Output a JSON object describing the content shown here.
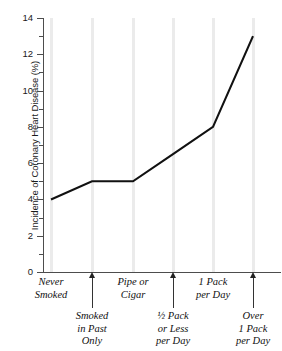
{
  "chart_data": {
    "type": "line",
    "title": "",
    "xlabel": "",
    "ylabel": "Incidence of Coronary Heart Disease (%)",
    "ylim": [
      0,
      14
    ],
    "ytick_labels": [
      "0",
      "2",
      "4",
      "6",
      "8",
      "10",
      "12",
      "14"
    ],
    "ytick_values": [
      0,
      2,
      4,
      6,
      8,
      10,
      12,
      14
    ],
    "yminor_values": [
      1,
      3,
      5,
      7,
      9,
      11,
      13
    ],
    "grid": "vertical-category-bands",
    "legend": "none",
    "categories": [
      "Never Smoked",
      "Smoked in Past Only",
      "Pipe or Cigar",
      "½ Pack or Less per Day",
      "1 Pack per Day",
      "Over 1 Pack per Day"
    ],
    "values": [
      4,
      5,
      5,
      6.5,
      8,
      13
    ],
    "line_color": "#111111",
    "gridline_color": "#ebebeb",
    "axis_color": "#4d4d4d"
  },
  "axis": {
    "y_title": "Incidence of Coronary Heart Disease (%)",
    "ticks": [
      {
        "label": "14",
        "value": 14
      },
      {
        "label": "12",
        "value": 12
      },
      {
        "label": "10",
        "value": 10
      },
      {
        "label": "8",
        "value": 8
      },
      {
        "label": "6",
        "value": 6
      },
      {
        "label": "4",
        "value": 4
      },
      {
        "label": "2",
        "value": 2
      },
      {
        "label": "0",
        "value": 0
      }
    ]
  },
  "categories": {
    "upper": [
      {
        "line1": "Never",
        "line2": "Smoked"
      },
      {
        "line1": "Pipe or",
        "line2": "Cigar"
      },
      {
        "line1": "1 Pack",
        "line2": "per Day"
      }
    ],
    "lower": [
      {
        "line1": "Smoked",
        "line2": "in Past",
        "line3": "Only"
      },
      {
        "line1": "½ Pack",
        "line2": "or Less",
        "line3": "per Day"
      },
      {
        "line1": "Over",
        "line2": "1 Pack",
        "line3": "per Day"
      }
    ]
  }
}
